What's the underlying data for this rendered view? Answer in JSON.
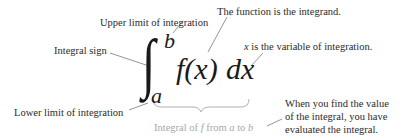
{
  "diagram": {
    "labels": {
      "upper_limit": "Upper limit of integration",
      "integrand": "The function is the integrand.",
      "integral_sign": "Integral sign",
      "variable_prefix": "x",
      "variable_rest": " is the variable of integration.",
      "lower_limit": "Lower limit of integration",
      "integral_of_prefix": "Integral of ",
      "integral_of_f": "f",
      "integral_of_from": " from ",
      "integral_of_a": "a",
      "integral_of_to": " to ",
      "integral_of_b": "b",
      "evaluated_line1": "When you find the value",
      "evaluated_line2": "of the integral, you have",
      "evaluated_line3": "evaluated the integral."
    },
    "expression": {
      "integral_symbol": "∫",
      "upper": "b",
      "lower": "a",
      "function": "f(x)",
      "differential": "dx"
    },
    "colors": {
      "text": "#2a2a2a",
      "muted": "#a8a8a8",
      "leader_line": "#7a7a7a",
      "brace": "#b0b0b0"
    }
  }
}
